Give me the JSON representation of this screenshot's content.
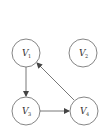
{
  "diagram": {
    "type": "directed-graph",
    "nodes": [
      {
        "id": "V1",
        "label": "V",
        "sub": "1",
        "x": 26,
        "y": 53
      },
      {
        "id": "V2",
        "label": "V",
        "sub": "2",
        "x": 83,
        "y": 53
      },
      {
        "id": "V3",
        "label": "V",
        "sub": "3",
        "x": 26,
        "y": 111
      },
      {
        "id": "V4",
        "label": "V",
        "sub": "4",
        "x": 84,
        "y": 111
      }
    ],
    "edges": [
      {
        "from": "V1",
        "to": "V3"
      },
      {
        "from": "V3",
        "to": "V4"
      },
      {
        "from": "V4",
        "to": "V1"
      }
    ],
    "colors": {
      "stroke": "#555555",
      "background": "#ffffff"
    }
  }
}
